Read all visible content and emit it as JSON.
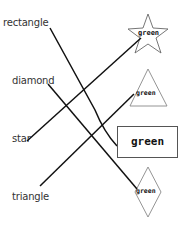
{
  "worksheet": {
    "left_words": [
      {
        "id": "rectangle",
        "label": "rectangle"
      },
      {
        "id": "diamond",
        "label": "diamond"
      },
      {
        "id": "star",
        "label": "star"
      },
      {
        "id": "triangle",
        "label": "triangle"
      }
    ],
    "right_shapes": [
      {
        "shape": "star",
        "label": "green"
      },
      {
        "shape": "triangle",
        "label": "green"
      },
      {
        "shape": "rectangle",
        "label": "green"
      },
      {
        "shape": "diamond",
        "label": "green"
      }
    ],
    "matches": [
      {
        "from": "rectangle",
        "to": "rectangle"
      },
      {
        "from": "star",
        "to": "star"
      },
      {
        "from": "diamond",
        "to": "diamond"
      },
      {
        "from": "triangle",
        "to": "triangle"
      }
    ],
    "colors": {
      "line": "#111111",
      "shape_outline": "#777777",
      "text": "#333333",
      "background": "#ffffff"
    }
  }
}
